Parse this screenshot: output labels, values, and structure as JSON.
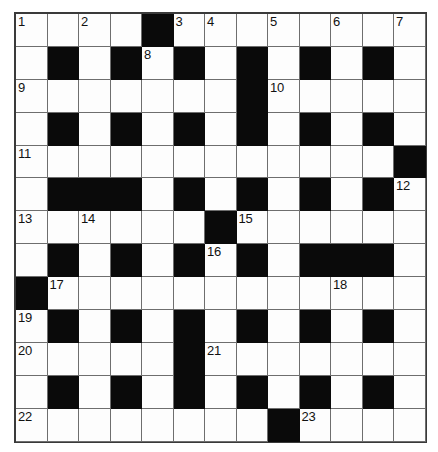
{
  "puzzle": {
    "type": "crossword-grid",
    "rows": 13,
    "cols": 13,
    "colors": {
      "block": "#0a0a0a",
      "cell": "#fdfdfd",
      "grid_line": "#6e6e6e",
      "border": "#3a3a3a",
      "number_text": "#111111"
    },
    "blocks": [
      [
        0,
        0,
        0,
        0,
        1,
        0,
        0,
        0,
        0,
        0,
        0,
        0,
        0
      ],
      [
        0,
        1,
        0,
        1,
        0,
        1,
        0,
        1,
        0,
        1,
        0,
        1,
        0
      ],
      [
        0,
        0,
        0,
        0,
        0,
        0,
        0,
        1,
        0,
        0,
        0,
        0,
        0
      ],
      [
        0,
        1,
        0,
        1,
        0,
        1,
        0,
        1,
        0,
        1,
        0,
        1,
        0
      ],
      [
        0,
        0,
        0,
        0,
        0,
        0,
        0,
        0,
        0,
        0,
        0,
        0,
        1
      ],
      [
        0,
        1,
        1,
        1,
        0,
        1,
        0,
        1,
        0,
        1,
        0,
        1,
        0
      ],
      [
        0,
        0,
        0,
        0,
        0,
        0,
        1,
        0,
        0,
        0,
        0,
        0,
        0
      ],
      [
        0,
        1,
        0,
        1,
        0,
        1,
        0,
        1,
        0,
        1,
        1,
        1,
        0
      ],
      [
        1,
        0,
        0,
        0,
        0,
        0,
        0,
        0,
        0,
        0,
        0,
        0,
        0
      ],
      [
        0,
        1,
        0,
        1,
        0,
        1,
        0,
        1,
        0,
        1,
        0,
        1,
        0
      ],
      [
        0,
        0,
        0,
        0,
        0,
        1,
        0,
        0,
        0,
        0,
        0,
        0,
        0
      ],
      [
        0,
        1,
        0,
        1,
        0,
        1,
        0,
        1,
        0,
        1,
        0,
        1,
        0
      ],
      [
        0,
        0,
        0,
        0,
        0,
        0,
        0,
        0,
        1,
        0,
        0,
        0,
        0
      ]
    ],
    "numbers": [
      {
        "row": 1,
        "col": 1,
        "label": "1"
      },
      {
        "row": 1,
        "col": 3,
        "label": "2"
      },
      {
        "row": 1,
        "col": 6,
        "label": "3"
      },
      {
        "row": 1,
        "col": 7,
        "label": "4"
      },
      {
        "row": 1,
        "col": 9,
        "label": "5"
      },
      {
        "row": 1,
        "col": 11,
        "label": "6"
      },
      {
        "row": 1,
        "col": 13,
        "label": "7"
      },
      {
        "row": 2,
        "col": 5,
        "label": "8"
      },
      {
        "row": 3,
        "col": 1,
        "label": "9"
      },
      {
        "row": 3,
        "col": 9,
        "label": "10"
      },
      {
        "row": 5,
        "col": 1,
        "label": "11"
      },
      {
        "row": 6,
        "col": 13,
        "label": "12"
      },
      {
        "row": 7,
        "col": 1,
        "label": "13"
      },
      {
        "row": 7,
        "col": 3,
        "label": "14"
      },
      {
        "row": 7,
        "col": 8,
        "label": "15"
      },
      {
        "row": 8,
        "col": 7,
        "label": "16"
      },
      {
        "row": 9,
        "col": 2,
        "label": "17"
      },
      {
        "row": 9,
        "col": 11,
        "label": "18"
      },
      {
        "row": 10,
        "col": 1,
        "label": "19"
      },
      {
        "row": 11,
        "col": 1,
        "label": "20"
      },
      {
        "row": 11,
        "col": 7,
        "label": "21"
      },
      {
        "row": 13,
        "col": 1,
        "label": "22"
      },
      {
        "row": 13,
        "col": 10,
        "label": "23"
      }
    ]
  }
}
